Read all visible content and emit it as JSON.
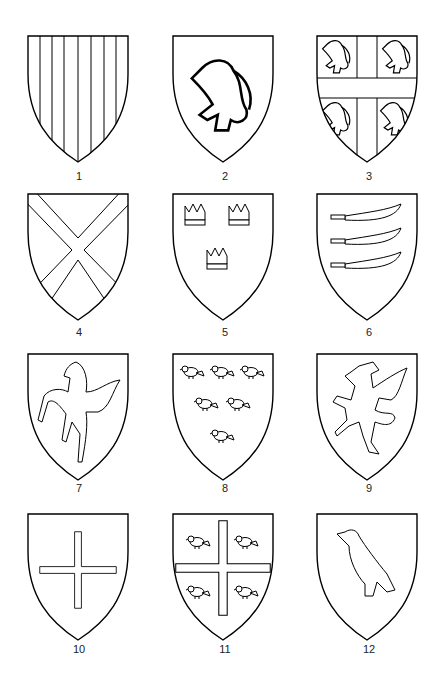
{
  "shields": [
    {
      "number": "1",
      "charge": "paly"
    },
    {
      "number": "2",
      "charge": "lion rampant"
    },
    {
      "number": "3",
      "charge": "cross between four lions"
    },
    {
      "number": "4",
      "charge": "saltire"
    },
    {
      "number": "5",
      "charge": "three crowns"
    },
    {
      "number": "6",
      "charge": "three seaxes"
    },
    {
      "number": "7",
      "charge": "horse rampant"
    },
    {
      "number": "8",
      "charge": "six martlets"
    },
    {
      "number": "9",
      "charge": "wyvern"
    },
    {
      "number": "10",
      "charge": "cross patonce"
    },
    {
      "number": "11",
      "charge": "cross patonce between four martlets"
    },
    {
      "number": "12",
      "charge": "raven"
    }
  ]
}
